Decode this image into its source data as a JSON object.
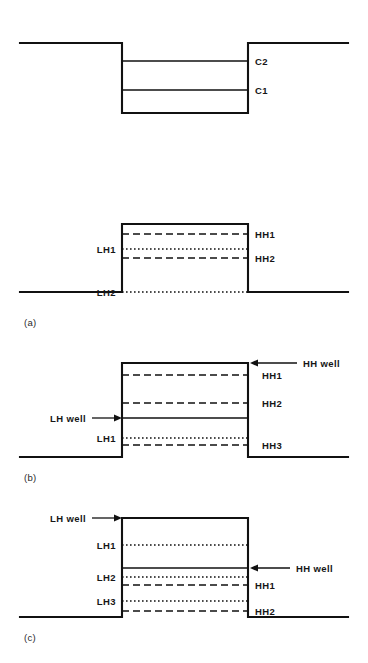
{
  "figure": {
    "canvas": {
      "width": 368,
      "height": 663
    },
    "geometry": {
      "baseline_left_x": 20,
      "baseline_right_x": 348,
      "well_left_x": 122,
      "well_right_x": 248
    },
    "panels": [
      {
        "id": "top",
        "tag": "",
        "type": "conduction-band-well",
        "description": "Downward (type-I electron) well with two confined levels",
        "barrier_y": 43,
        "well_bottom_y": 113,
        "levels": [
          {
            "label": "C2",
            "y": 61,
            "style": "solid",
            "label_side": "right",
            "label_x": 255
          },
          {
            "label": "C1",
            "y": 90,
            "style": "solid",
            "label_side": "right",
            "label_x": 255
          }
        ]
      },
      {
        "id": "a",
        "tag": "(a)",
        "tag_x": 24,
        "tag_y": 326,
        "type": "valence-band-well",
        "description": "Upward valence well: HH1, LH1, HH2 confined, LH2 at barrier edge",
        "barrier_y": 224,
        "well_bottom_y": 292,
        "levels": [
          {
            "label": "HH1",
            "y": 234,
            "style": "dashed",
            "label_side": "right",
            "label_x": 255
          },
          {
            "label": "LH1",
            "y": 249,
            "style": "dotted",
            "label_side": "left",
            "label_x": 116
          },
          {
            "label": "HH2",
            "y": 258,
            "style": "dashed",
            "label_side": "right",
            "label_x": 255
          },
          {
            "label": "LH2",
            "y": 292,
            "style": "dotted",
            "label_side": "left",
            "label_x": 116
          }
        ],
        "arrows": []
      },
      {
        "id": "b",
        "tag": "(b)",
        "tag_x": 24,
        "tag_y": 481,
        "type": "staggered-well",
        "description": "HH well at top of barrier, LH well inside; HH1, HH2, HH3 and LH1",
        "barrier_y": 363,
        "well_bottom_y": 457,
        "levels": [
          {
            "label": "HH1",
            "y": 375,
            "style": "dashed",
            "label_side": "right",
            "label_x": 262
          },
          {
            "label": "HH2",
            "y": 403,
            "style": "dashed",
            "label_side": "right",
            "label_x": 262
          },
          {
            "label": "LH1",
            "y": 438,
            "style": "dotted",
            "label_side": "left",
            "label_x": 116
          },
          {
            "label": "HH3",
            "y": 445,
            "style": "dashed",
            "label_side": "right",
            "label_x": 262
          }
        ],
        "well_edges": [
          {
            "label": "LH well",
            "y": 418,
            "style": "solid"
          }
        ],
        "arrows": [
          {
            "label": "HH well",
            "y": 363,
            "direction": "left",
            "tip_x": 250,
            "tail_x": 297,
            "text_x": 303,
            "text_anchor": "start"
          },
          {
            "label": "LH well",
            "y": 418,
            "direction": "right",
            "tip_x": 122,
            "tail_x": 92,
            "text_x": 86,
            "text_anchor": "end"
          }
        ]
      },
      {
        "id": "c",
        "tag": "(c)",
        "tag_x": 24,
        "tag_y": 641,
        "type": "staggered-well",
        "description": "LH well at top of barrier, HH well inside; LH1, LH2, LH3 and HH1, HH2",
        "barrier_y": 518,
        "well_bottom_y": 617,
        "levels": [
          {
            "label": "LH1",
            "y": 545,
            "style": "dotted",
            "label_side": "left",
            "label_x": 116
          },
          {
            "label": "LH2",
            "y": 577,
            "style": "dotted",
            "label_side": "left",
            "label_x": 116
          },
          {
            "label": "HH1",
            "y": 585,
            "style": "dashed",
            "label_side": "right",
            "label_x": 255
          },
          {
            "label": "LH3",
            "y": 601,
            "style": "dotted",
            "label_side": "left",
            "label_x": 116
          },
          {
            "label": "HH2",
            "y": 611,
            "style": "dashed",
            "label_side": "right",
            "label_x": 255
          }
        ],
        "well_edges": [
          {
            "label": "HH well",
            "y": 568,
            "style": "solid"
          }
        ],
        "arrows": [
          {
            "label": "LH well",
            "y": 518,
            "direction": "right",
            "tip_x": 122,
            "tail_x": 92,
            "text_x": 86,
            "text_anchor": "end"
          },
          {
            "label": "HH well",
            "y": 568,
            "direction": "left",
            "tip_x": 250,
            "tail_x": 290,
            "text_x": 296,
            "text_anchor": "start"
          }
        ]
      }
    ],
    "legend_styles": {
      "heavy_hole": "dashed",
      "light_hole": "dotted",
      "band_edge": "solid"
    },
    "colors": {
      "ink": "#111111",
      "background": "#ffffff"
    }
  }
}
